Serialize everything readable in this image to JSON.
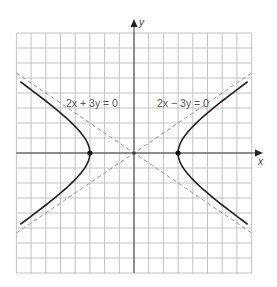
{
  "chart_data": {
    "type": "line",
    "title": "",
    "xlabel": "x",
    "ylabel": "y",
    "xlim": [
      -8,
      8
    ],
    "ylim": [
      -8,
      8
    ],
    "grid": true,
    "grid_step": 1,
    "equation": "x^2/9 - y^2/4 = 1",
    "series": [
      {
        "name": "hyperbola",
        "style": "solid",
        "description": "x^2/9 - y^2/4 = 1, two branches opening left and right"
      },
      {
        "name": "asymptote 2x + 3y = 0",
        "style": "dashed",
        "points": [
          [
            -8,
            5.33
          ],
          [
            8,
            -5.33
          ]
        ]
      },
      {
        "name": "asymptote 2x - 3y = 0",
        "style": "dashed",
        "points": [
          [
            -8,
            -5.33
          ],
          [
            8,
            5.33
          ]
        ]
      }
    ],
    "vertices": [
      [
        -3,
        0
      ],
      [
        3,
        0
      ]
    ],
    "center": [
      0,
      0
    ],
    "annotations": [
      {
        "text": "2x + 3y = 0",
        "x": -4.6,
        "y": 3.1
      },
      {
        "text": "2x − 3y = 0",
        "x": 1.6,
        "y": 3.1
      }
    ]
  },
  "labels": {
    "x_axis": "x",
    "y_axis": "y",
    "asym1": "2x + 3y = 0",
    "asym2": "2x − 3y = 0"
  },
  "colors": {
    "grid": "#b4b4b4",
    "axis": "#3a3a3a",
    "curve": "#222222",
    "asymptote": "#8a8a8a"
  }
}
